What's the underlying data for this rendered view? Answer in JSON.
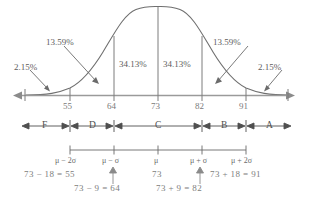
{
  "figure": {
    "type": "normal-distribution-empirical-rule",
    "mean": 73,
    "sigma": 9,
    "axis": {
      "tick_labels": [
        "55",
        "64",
        "73",
        "82",
        "91"
      ],
      "tick_values": [
        55,
        64,
        73,
        82,
        91
      ],
      "left_arrow": "◀",
      "right_arrow": "▶"
    },
    "percent_labels": [
      {
        "text": "2.15%",
        "region": "left-tail"
      },
      {
        "text": "13.59%",
        "region": "left-outer"
      },
      {
        "text": "34.13%",
        "region": "left-inner"
      },
      {
        "text": "34.13%",
        "region": "right-inner"
      },
      {
        "text": "13.59%",
        "region": "right-outer"
      },
      {
        "text": "2.15%",
        "region": "right-tail"
      }
    ],
    "grades": [
      {
        "label": "F",
        "range": "below 55"
      },
      {
        "label": "D",
        "range": "55 to 64"
      },
      {
        "label": "C",
        "range": "64 to 82"
      },
      {
        "label": "B",
        "range": "82 to 91"
      },
      {
        "label": "A",
        "range": "above 91"
      }
    ],
    "sigma_labels": [
      "μ − 2σ",
      "μ − σ",
      "μ",
      "μ + σ",
      "μ + 2σ"
    ],
    "equations": [
      {
        "text": "73 − 18 = 55",
        "row": "upper",
        "side": "left"
      },
      {
        "text": "73",
        "row": "upper",
        "side": "center"
      },
      {
        "text": "73 + 18 = 91",
        "row": "upper",
        "side": "right"
      },
      {
        "text": "73 − 9 = 64",
        "row": "lower",
        "side": "left"
      },
      {
        "text": "73 + 9 = 82",
        "row": "lower",
        "side": "right"
      }
    ],
    "colors": {
      "curve": "#6f6f6f",
      "axis": "#9a9a9a",
      "text": "#6e6e6e",
      "equation_text": "#8a8a8a",
      "background": "#ffffff"
    }
  }
}
